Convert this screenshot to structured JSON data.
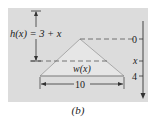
{
  "figure": {
    "caption": "(b)",
    "height_label": "h(x) = 3 + x",
    "width_label": "w(x)",
    "base_label": "10",
    "axis_ticks": [
      {
        "label": "0",
        "y": 39
      },
      {
        "label": "x",
        "y": 61
      },
      {
        "label": "4",
        "y": 76
      }
    ],
    "colors": {
      "panel": "#dcdcdc",
      "shape_fill": "#e8e8e8",
      "line": "#444444",
      "dash": "#555555",
      "text": "#222222"
    }
  }
}
